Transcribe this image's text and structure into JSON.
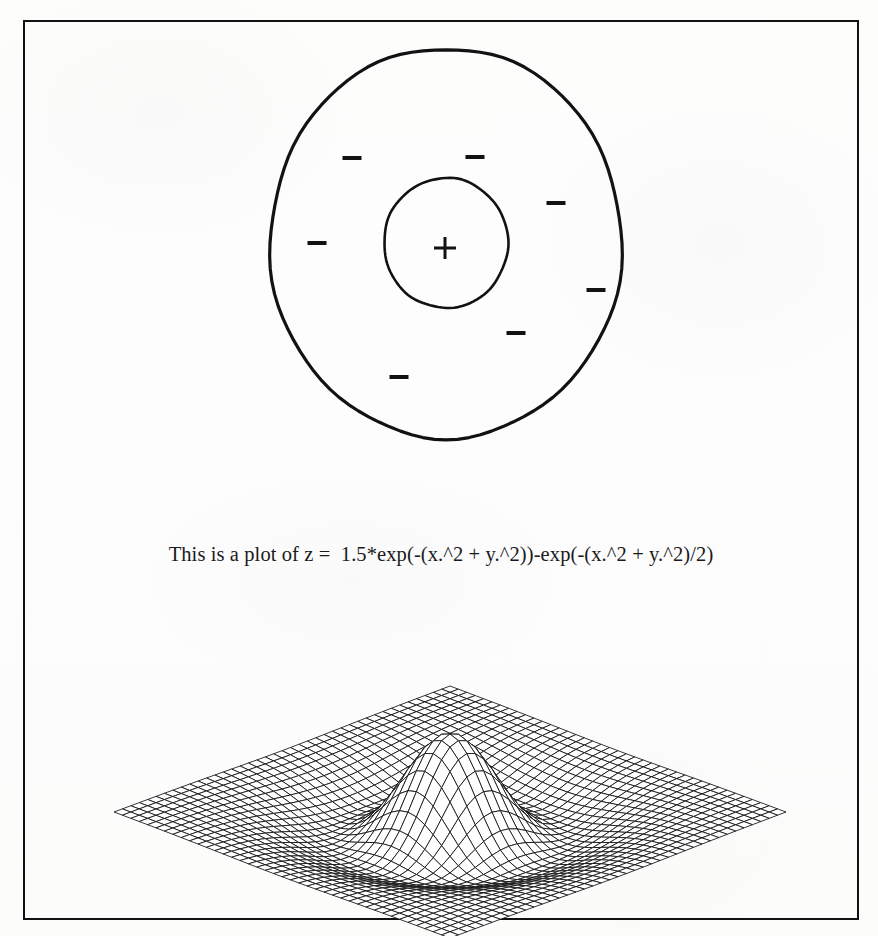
{
  "page": {
    "background_color": "#fdfdfc",
    "ink_color": "#121212",
    "border_color": "#121212",
    "border_width_px": 2
  },
  "caption": {
    "text": "This is a plot of z =  1.5*exp(-(x.^2 + y.^2))-exp(-(x.^2 + y.^2)/2)",
    "font_size_px": 20.5
  },
  "chart_data": [
    {
      "type": "contour",
      "name": "contour-plot",
      "title": "",
      "xlabel": "",
      "ylabel": "",
      "function": "z = 1.5*exp(-(x^2 + y^2)) - exp(-(x^2 + y^2)/2)",
      "formula_params": {
        "amp_inner": 1.5,
        "amp_outer": 1.0,
        "sigma_inner": 1.0,
        "sigma_outer": 2.0
      },
      "xlim": [
        -3,
        3
      ],
      "ylim": [
        -3,
        3
      ],
      "grid": false,
      "legend": false,
      "center_px": {
        "x": 446,
        "y": 243
      },
      "contours": [
        {
          "label": "outer-contour",
          "level": -0.18,
          "rx": 176,
          "ry": 195,
          "stroke_width": 3.2
        },
        {
          "label": "inner-contour",
          "level": 0.0,
          "rx": 62,
          "ry": 65,
          "stroke_width": 2.6
        }
      ],
      "markers": [
        {
          "symbol": "+",
          "sign": "positive",
          "x": 445,
          "y": 248,
          "size": 26
        },
        {
          "symbol": "-",
          "sign": "negative",
          "x": 352,
          "y": 158,
          "size": 20
        },
        {
          "symbol": "-",
          "sign": "negative",
          "x": 475,
          "y": 157,
          "size": 20
        },
        {
          "symbol": "-",
          "sign": "negative",
          "x": 556,
          "y": 203,
          "size": 20
        },
        {
          "symbol": "-",
          "sign": "negative",
          "x": 317,
          "y": 243,
          "size": 20
        },
        {
          "symbol": "-",
          "sign": "negative",
          "x": 596,
          "y": 290,
          "size": 20
        },
        {
          "symbol": "-",
          "sign": "negative",
          "x": 516,
          "y": 333,
          "size": 20
        },
        {
          "symbol": "-",
          "sign": "negative",
          "x": 399,
          "y": 377,
          "size": 20
        }
      ]
    },
    {
      "type": "surface",
      "name": "mesh-plot",
      "render_style": "wireframe-mesh",
      "title": "",
      "xlabel": "",
      "ylabel": "",
      "zlabel": "",
      "function": "z = 1.5*exp(-(x^2 + y^2)) - exp(-(x^2 + y^2)/2)",
      "formula_params": {
        "amp_inner": 1.5,
        "amp_outer": 1.0,
        "sigma_inner": 1.0,
        "sigma_outer": 2.0
      },
      "xlim": [
        -3,
        3
      ],
      "ylim": [
        -3,
        3
      ],
      "zlim": [
        -1,
        1.5
      ],
      "grid_n": 41,
      "peak_value": 0.5,
      "trough_value": -0.37,
      "view": {
        "azimuth_deg": -37.5,
        "elevation_deg": 25
      },
      "axes_visible": false,
      "grid": false,
      "legend": false,
      "stroke_color": "#111111",
      "stroke_width": 0.85
    }
  ]
}
